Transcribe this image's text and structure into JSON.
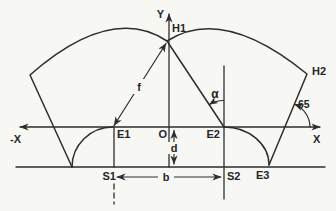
{
  "figure": {
    "type": "geometric-optics-diagram",
    "background_color": "#f7f7f4",
    "stroke_color": "#2e2e2e",
    "labels": {
      "y_axis": "Y",
      "x_axis": "X",
      "x_axis_negative": "-X",
      "origin": "O",
      "h1": "H1",
      "h2": "H2",
      "e1": "E1",
      "e2": "E2",
      "e3": "E3",
      "s1": "S1",
      "s2": "S2",
      "focal_length": "f",
      "depth": "d",
      "base_width": "b",
      "alpha_angle": "α",
      "edge_angle": "65"
    }
  }
}
